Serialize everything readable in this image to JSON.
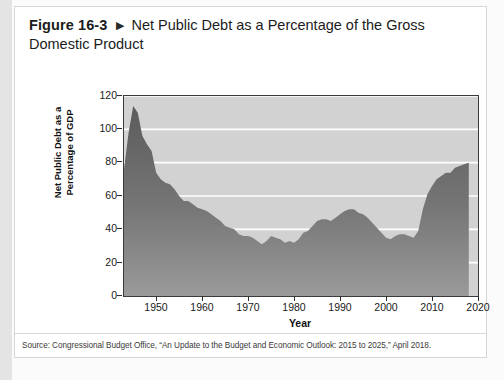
{
  "figure": {
    "label": "Figure 16-3",
    "arrow_icon": "triangle-right-icon",
    "title": "Net Public Debt as a Percentage of the Gross Domestic Product"
  },
  "source": {
    "text": "Source: Congressional Budget Office, “An Update to the Budget and Economic Outlook: 2015 to 2025,” April 2018."
  },
  "colors": {
    "plot_background": "#d2d2d2",
    "area_fill_top": "#5e5e5e",
    "area_fill_bottom": "#8d8d8d",
    "gridline": "#ffffff",
    "axis": "#3b3b3b",
    "card_background": "#ffffff",
    "page_background": "#fbfbfb"
  },
  "chart_data": {
    "type": "area",
    "title": "Net Public Debt as a Percentage of the Gross Domestic Product",
    "xlabel": "Year",
    "ylabel": "Net Public Debt as a Percentage of GDP",
    "xlim": [
      1944,
      2021
    ],
    "ylim": [
      0,
      120
    ],
    "grid": true,
    "legend": "none",
    "ytick_labels": [
      "0",
      "20",
      "40",
      "60",
      "80",
      "100",
      "120"
    ],
    "ytick_values": [
      0,
      20,
      40,
      60,
      80,
      100,
      120
    ],
    "xtick_labels": [
      "1950",
      "1960",
      "1970",
      "1980",
      "1990",
      "2000",
      "2010",
      "2020"
    ],
    "xtick_values": [
      1950,
      1960,
      1970,
      1980,
      1990,
      2000,
      2010,
      2020
    ],
    "x": [
      1944,
      1945,
      1946,
      1947,
      1948,
      1949,
      1950,
      1951,
      1952,
      1953,
      1954,
      1955,
      1956,
      1957,
      1958,
      1959,
      1960,
      1961,
      1962,
      1963,
      1964,
      1965,
      1966,
      1967,
      1968,
      1969,
      1970,
      1971,
      1972,
      1973,
      1974,
      1975,
      1976,
      1977,
      1978,
      1979,
      1980,
      1981,
      1982,
      1983,
      1984,
      1985,
      1986,
      1987,
      1988,
      1989,
      1990,
      1991,
      1992,
      1993,
      1994,
      1995,
      1996,
      1997,
      1998,
      1999,
      2000,
      2001,
      2002,
      2003,
      2004,
      2005,
      2006,
      2007,
      2008,
      2009,
      2010,
      2011,
      2012,
      2013,
      2014,
      2015,
      2016,
      2017,
      2018,
      2019
    ],
    "y": [
      76,
      98,
      114,
      110,
      96,
      91,
      87,
      74,
      70,
      68,
      67,
      64,
      60,
      57,
      57,
      55,
      53,
      52,
      51,
      49,
      47,
      45,
      42,
      41,
      40,
      37,
      36,
      36,
      35,
      33,
      31,
      33,
      36,
      35,
      34,
      32,
      33,
      32,
      34,
      38,
      39,
      42,
      45,
      46,
      46,
      45,
      47,
      49,
      51,
      52,
      52,
      50,
      49,
      47,
      44,
      41,
      38,
      35,
      34,
      36,
      37,
      37,
      36,
      35,
      39,
      52,
      61,
      66,
      70,
      72,
      74,
      74,
      77,
      78,
      79,
      80
    ],
    "annotations": [
      {
        "label": "postwar peak",
        "x": 1946,
        "y": 114
      },
      {
        "label": "trough",
        "x": 1974,
        "y": 31
      },
      {
        "label": "2008 crisis rise",
        "x": 2009,
        "y": 52
      }
    ]
  }
}
